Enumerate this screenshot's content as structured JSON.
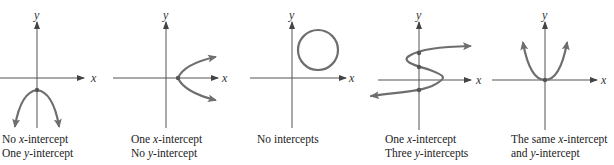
{
  "figure": {
    "axis_labels": {
      "x": "x",
      "y": "y"
    },
    "curve_color": "#6e6e6e",
    "axis_color": "#555555",
    "panels": [
      {
        "id": "panel-1",
        "shape": "downward parabola",
        "caption_line1": "No x-intercept",
        "caption_line2": "One y-intercept",
        "x_intercepts": 0,
        "y_intercepts": 1
      },
      {
        "id": "panel-2",
        "shape": "rightward opening parabola",
        "caption_line1": "One x-intercept",
        "caption_line2": "No y-intercept",
        "x_intercepts": 1,
        "y_intercepts": 0
      },
      {
        "id": "panel-3",
        "shape": "circle in first quadrant",
        "caption_line1": "No intercepts",
        "caption_line2": "",
        "x_intercepts": 0,
        "y_intercepts": 0
      },
      {
        "id": "panel-4",
        "shape": "sideways S curve",
        "caption_line1": "One x-intercept",
        "caption_line2": "Three y-intercepts",
        "x_intercepts": 1,
        "y_intercepts": 3
      },
      {
        "id": "panel-5",
        "shape": "upward parabola through origin",
        "caption_line1": "The same x-intercept",
        "caption_line2": "and y-intercept",
        "x_intercepts": 1,
        "y_intercepts": 1
      }
    ]
  }
}
